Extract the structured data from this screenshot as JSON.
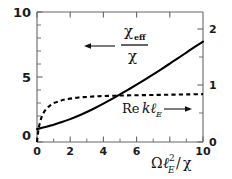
{
  "figure": {
    "background": "#ffffff",
    "frame_color": "#555555",
    "curve_color": "#000000"
  },
  "chart_data": {
    "type": "line",
    "title": "",
    "xlabel": "ΩℓE²/χ",
    "xlabel_parts": {
      "omega": "Ω",
      "ell": "ℓ",
      "sub": "E",
      "sup": "2",
      "slash": "/",
      "chi": "χ"
    },
    "xlim": [
      0,
      10
    ],
    "xticks": [
      0,
      2,
      4,
      6,
      8,
      10
    ],
    "xticklabels": [
      "0",
      "2",
      "4",
      "6",
      "8",
      "10"
    ],
    "xminor_step": 1,
    "grid": false,
    "legend_position": "inline-annotations",
    "left_axis": {
      "label": "χeff/χ",
      "lim": [
        0,
        10
      ],
      "ticks": [
        0,
        5,
        10
      ],
      "ticklabels": [
        "0",
        "5",
        "10"
      ],
      "minor_step": 1
    },
    "right_axis": {
      "label": "Re kℓE",
      "lim": [
        0,
        2.3077
      ],
      "ticks": [
        0,
        1,
        2
      ],
      "ticklabels": [
        "0",
        "1",
        "2"
      ],
      "minor_step": 0.5
    },
    "series": [
      {
        "name": "χeff/χ",
        "axis": "left",
        "style": "solid",
        "x": [
          0,
          0.25,
          0.5,
          0.75,
          1.0,
          1.5,
          2.0,
          2.5,
          3.0,
          3.5,
          4.0,
          4.5,
          5.0,
          5.5,
          6.0,
          6.5,
          7.0,
          7.5,
          8.0,
          8.5,
          9.0,
          9.5,
          10.0
        ],
        "values": [
          1.0,
          1.07,
          1.15,
          1.24,
          1.33,
          1.53,
          1.76,
          2.02,
          2.31,
          2.62,
          2.95,
          3.3,
          3.66,
          4.03,
          4.41,
          4.8,
          5.2,
          5.61,
          6.03,
          6.45,
          6.88,
          7.31,
          7.72
        ]
      },
      {
        "name": "Re kℓE",
        "axis": "right",
        "style": "dashed",
        "x": [
          0,
          0.1,
          0.25,
          0.4,
          0.6,
          0.8,
          1.0,
          1.3,
          1.6,
          2.0,
          2.5,
          3.0,
          3.5,
          4.0,
          5.0,
          6.0,
          7.0,
          8.0,
          9.0,
          10.0
        ],
        "values": [
          0.0,
          0.24,
          0.42,
          0.52,
          0.6,
          0.65,
          0.69,
          0.72,
          0.75,
          0.77,
          0.79,
          0.8,
          0.81,
          0.815,
          0.825,
          0.83,
          0.835,
          0.84,
          0.845,
          0.85
        ]
      }
    ],
    "annotations": [
      {
        "name": "chi-eff-over-chi",
        "numerator": "χ",
        "numerator_sub": "eff",
        "denominator": "χ",
        "arrow": "left",
        "refers_to": "χeff/χ"
      },
      {
        "name": "re-k-ell-e",
        "text": "Re",
        "italic": "kℓ",
        "sub": "E",
        "arrow": "right",
        "refers_to": "Re kℓE"
      }
    ]
  }
}
